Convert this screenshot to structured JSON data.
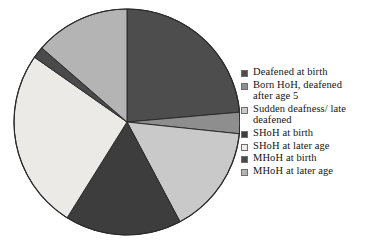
{
  "chart_data": {
    "type": "pie",
    "title": "",
    "subtitle": "",
    "xlabel": "",
    "ylabel": "",
    "grid": false,
    "legend_position": "right",
    "start_angle_deg": 0,
    "direction": "clockwise",
    "center": {
      "cx": 127,
      "cy": 122,
      "r": 113
    },
    "categories": [
      "Deafened at birth",
      "Born HoH, deafened after age 5",
      "Sudden deafness/ late deafened",
      "SHoH at birth",
      "SHoH at later age",
      "MHoH at birth",
      "MHoH at later age"
    ],
    "values": [
      23.6,
      3.1,
      15.6,
      16.7,
      25.8,
      1.7,
      13.5
    ],
    "unit": "percent",
    "slices": [
      {
        "label": "Deafened at birth",
        "value": 23.6,
        "start_deg": 0.0,
        "end_deg": 85.0,
        "color": "#4d4d4d",
        "stroke": "#2b2b2b"
      },
      {
        "label": "Born HoH, deafened after age 5",
        "value": 3.1,
        "start_deg": 85.0,
        "end_deg": 96.0,
        "color": "#8e8e8e",
        "stroke": "#2b2b2b"
      },
      {
        "label": "Sudden deafness/ late deafened",
        "value": 15.6,
        "start_deg": 96.0,
        "end_deg": 152.0,
        "color": "#c9c9c9",
        "stroke": "#2b2b2b"
      },
      {
        "label": "SHoH at birth",
        "value": 16.7,
        "start_deg": 152.0,
        "end_deg": 212.0,
        "color": "#3d3d3d",
        "stroke": "#2b2b2b"
      },
      {
        "label": "SHoH at later age",
        "value": 25.8,
        "start_deg": 212.0,
        "end_deg": 305.0,
        "color": "#eceae6",
        "stroke": "#2b2b2b"
      },
      {
        "label": "MHoH at birth",
        "value": 1.7,
        "start_deg": 305.0,
        "end_deg": 311.0,
        "color": "#4a4a4a",
        "stroke": "#2b2b2b"
      },
      {
        "label": "MHoH at later age",
        "value": 13.5,
        "start_deg": 311.0,
        "end_deg": 360.0,
        "color": "#b4b4b4",
        "stroke": "#2b2b2b"
      }
    ]
  },
  "legend": {
    "items": [
      {
        "label": "Deafened at birth",
        "swatch": "#4d4d4d"
      },
      {
        "label": "Born HoH, deafened\nafter age 5",
        "swatch": "#8e8e8e"
      },
      {
        "label": "Sudden deafness/ late\ndeafened",
        "swatch": "#c9c9c9"
      },
      {
        "label": "SHoH at birth",
        "swatch": "#3d3d3d"
      },
      {
        "label": "SHoH at later age",
        "swatch": "#eceae6"
      },
      {
        "label": "MHoH at birth",
        "swatch": "#4a4a4a"
      },
      {
        "label": "MHoH at later age",
        "swatch": "#b4b4b4"
      }
    ]
  },
  "colors": {
    "background": "#ffffff",
    "outline": "#2b2b2b",
    "text": "#141414"
  }
}
